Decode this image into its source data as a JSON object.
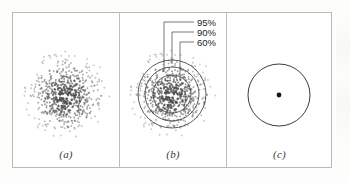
{
  "figure": {
    "title": "",
    "panels": [
      {
        "id": "a",
        "label": "(a)",
        "content": "gaussian-scatter-cloud",
        "description": "Dense scatter of points distributed around a common center, densest at the middle and thinning outward."
      },
      {
        "id": "b",
        "label": "(b)",
        "content": "scatter-with-confidence-contours",
        "description": "Same scatter cloud overlaid with three concentric confidence circles, each identified by a leader line and a percentage label."
      },
      {
        "id": "c",
        "label": "(c)",
        "content": "idealized-circle-with-center-point",
        "description": "A single circle with a filled dot marking the center."
      }
    ],
    "contour_labels": [
      {
        "value": "95%",
        "order": 0
      },
      {
        "value": "90%",
        "order": 1
      },
      {
        "value": "60%",
        "order": 2
      }
    ],
    "colors": {
      "frame": "#b9b9b9",
      "divider": "#bdbdbd",
      "contour_stroke": "#4a4a4a",
      "leader_stroke": "#555555",
      "circle_stroke": "#3c3c3c",
      "center_dot": "#161616",
      "label_text": "#242424",
      "panel_label_text": "#3a3a3a",
      "background": "#ffffff"
    }
  },
  "chart_data": {
    "type": "scatter",
    "title": "",
    "xlabel": "",
    "ylabel": "",
    "grid": false,
    "legend_position": "none",
    "panels": [
      {
        "panel": "a",
        "label": "(a)",
        "type": "scatter",
        "n_points": 620,
        "center": [
          66,
          95
        ],
        "distribution": "bivariate-gaussian",
        "sigma_px": 17,
        "max_radius_px": 44,
        "annotations": []
      },
      {
        "panel": "b",
        "label": "(b)",
        "type": "scatter",
        "n_points": 620,
        "center": [
          172,
          94
        ],
        "distribution": "bivariate-gaussian",
        "sigma_px": 17,
        "max_radius_px": 44,
        "contours": [
          {
            "label": "60%",
            "radius_px": 19
          },
          {
            "label": "90%",
            "radius_px": 27
          },
          {
            "label": "95%",
            "radius_px": 34
          }
        ],
        "annotations": [
          "95%",
          "90%",
          "60%"
        ]
      },
      {
        "panel": "c",
        "label": "(c)",
        "type": "scatter",
        "n_points": 1,
        "center": [
          279,
          95
        ],
        "circle_radius_px": 31,
        "annotations": []
      }
    ]
  }
}
